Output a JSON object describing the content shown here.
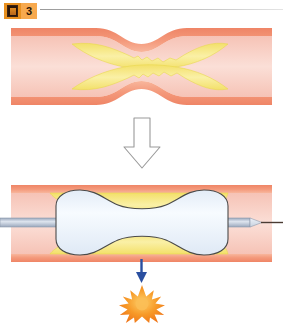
{
  "header": {
    "badge_icon_name": "picture-icon",
    "badge_number": "3",
    "divider_name": "header-rule"
  },
  "figure": {
    "panels": [
      {
        "id": "before",
        "label": "Stenosed artery narrowed by atherosclerotic plaque",
        "vessel_top": 28,
        "vessel_bottom": 105
      },
      {
        "id": "after",
        "label": "Inflated balloon catheter compressing the plaque",
        "vessel_top": 185,
        "vessel_bottom": 262
      }
    ],
    "transition_arrow": {
      "name": "down-arrow-outline",
      "direction": "down",
      "style": "hollow-outline"
    },
    "result_arrow": {
      "name": "blue-down-arrow",
      "direction": "down",
      "color": "#2a4fa0"
    },
    "burst": {
      "name": "starburst",
      "points": 12,
      "color": "#f07818",
      "center_color": "#fbb040"
    },
    "catheter": {
      "name": "balloon-catheter",
      "shaft_color": "#b9c4d6",
      "balloon_color": "#eef4fb",
      "tip_name": "catheter-tip",
      "guidewire_color": "#4a3b33"
    }
  },
  "colors": {
    "vessel_wall": "#f08a6a",
    "vessel_wall_light": "#f4a98c",
    "lumen": "#f7cdc2",
    "lumen_light": "#fbe4dd",
    "plaque": "#f5e87a",
    "plaque_edge": "#efd94a",
    "outline": "#5a4a42",
    "accent_orange": "#e8901f",
    "accent_blue": "#2a4fa0",
    "badge_bg": "#f7a94e"
  }
}
